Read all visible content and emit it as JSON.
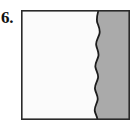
{
  "figure": {
    "label": "6.",
    "caption_text": "6.",
    "box": {
      "left": 21,
      "top": 10,
      "width": 109,
      "height": 110,
      "border_color": "#2a2a2a",
      "border_width": 1.6
    },
    "regions": [
      {
        "name": "left-region",
        "semantic": "unshaded-portion",
        "fill_color": "#fbfbfb",
        "approx_fraction": 0.7
      },
      {
        "name": "right-region",
        "semantic": "shaded-portion",
        "fill_color": "#aaaaaa",
        "approx_fraction": 0.3
      }
    ],
    "divider": {
      "name": "wavy-divider-line",
      "style": "freehand-wavy-vertical",
      "stroke_color": "#1c1c1c",
      "stroke_width": 1.8,
      "path": "M 77.5 0 C 76.2 5, 75.0 9, 76.4 13 C 77.9 17, 79.6 20, 78.4 24 C 77.2 28, 74.6 31, 75.2 35 C 75.8 39, 78.2 42, 77.4 46 C 76.6 50, 73.8 53, 74.4 57 C 75.0 61, 77.8 64, 77.0 68 C 76.2 72, 73.4 75, 74.0 79 C 74.6 83, 77.4 86, 76.6 90 C 75.8 94, 73.2 97, 73.8 101 C 74.4 105, 77.0 107, 76.2 110"
    }
  },
  "colors": {
    "page_background": "#ffffff",
    "shaded": "#aaaaaa",
    "unshaded": "#fbfbfb",
    "outline": "#2a2a2a",
    "label_text": "#111111"
  }
}
